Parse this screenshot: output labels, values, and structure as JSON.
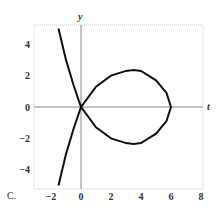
{
  "figure_label": "C.",
  "chart_data": {
    "type": "line",
    "title": "",
    "xlabel": "t",
    "ylabel": "y",
    "xlim": [
      -3.1,
      8.2
    ],
    "ylim": [
      -5.3,
      5.3
    ],
    "x_ticks": [
      "−2",
      "0",
      "2",
      "4",
      "6",
      "8"
    ],
    "y_ticks": [
      "4",
      "2",
      "0",
      "−2",
      "−4"
    ],
    "grid": false,
    "legend": null,
    "series": [
      {
        "name": "curve",
        "description": "Nodal curve with self-intersection at origin, loop to t=6, branches to t≈-1.5 at y=±5",
        "x": [
          -1.5,
          -1.0,
          -0.5,
          0,
          1,
          2,
          3,
          3.5,
          4,
          5,
          5.7,
          6,
          5.7,
          5,
          4,
          3.5,
          3,
          2,
          1,
          0,
          -0.5,
          -1.0,
          -1.5
        ],
        "y": [
          5.0,
          3.0,
          1.4,
          0,
          1.3,
          2.0,
          2.3,
          2.35,
          2.3,
          1.7,
          0.9,
          0,
          -0.9,
          -1.7,
          -2.3,
          -2.35,
          -2.3,
          -2.0,
          -1.3,
          0,
          -1.4,
          -3.0,
          -5.0
        ]
      }
    ]
  }
}
